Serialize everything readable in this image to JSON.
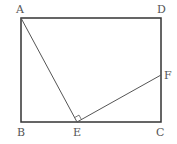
{
  "diagram": {
    "type": "geometry",
    "shape": "rectangle ABCD with segments AE and EF, right angle at E",
    "stroke_color": "#333333",
    "thin_stroke_color": "#555555",
    "points": {
      "A": {
        "label": "A",
        "x": 21,
        "y": 18
      },
      "D": {
        "label": "D",
        "x": 161,
        "y": 18
      },
      "B": {
        "label": "B",
        "x": 21,
        "y": 122
      },
      "C": {
        "label": "C",
        "x": 161,
        "y": 122
      },
      "E": {
        "label": "E",
        "x": 77,
        "y": 122
      },
      "F": {
        "label": "F",
        "x": 161,
        "y": 75
      }
    },
    "segments": [
      "AB",
      "BC",
      "CD",
      "DA",
      "AE",
      "EF"
    ],
    "right_angle": "AEF"
  }
}
